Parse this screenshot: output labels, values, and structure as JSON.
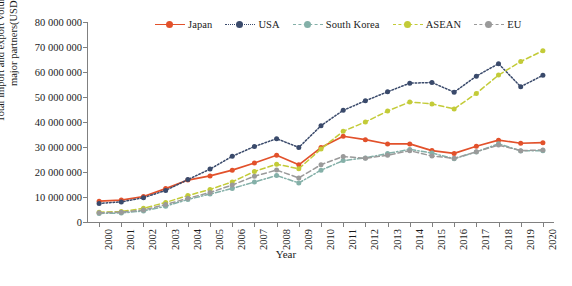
{
  "titles": {
    "y_axis": "Total import and export volume of China with major partners(USD million)",
    "x_axis": "Year"
  },
  "chart_data": {
    "type": "line",
    "title": "",
    "xlabel": "Year",
    "ylabel": "Total import and export volume of China with major partners(USD million)",
    "xlim": [
      2000,
      2020
    ],
    "ylim": [
      0,
      80000000
    ],
    "ytick_step": 10000000,
    "grid": false,
    "legend_position": "top-center",
    "categories": [
      "2000",
      "2001",
      "2002",
      "2003",
      "2004",
      "2005",
      "2006",
      "2007",
      "2008",
      "2009",
      "2010",
      "2011",
      "2012",
      "2013",
      "2014",
      "2015",
      "2016",
      "2017",
      "2018",
      "2019",
      "2020"
    ],
    "ytick_labels": [
      "0",
      "10 000 000",
      "20 000 000",
      "30 000 000",
      "40 000 000",
      "50 000 000",
      "60 000 000",
      "70 000 000",
      "80 000 000"
    ],
    "series": [
      {
        "name": "Japan",
        "color": "#E2512B",
        "dash": "solid",
        "values": [
          8310000,
          8770000,
          10190000,
          13360000,
          16780000,
          18440000,
          20740000,
          23600000,
          26680000,
          22870000,
          29770000,
          34290000,
          32940000,
          31210000,
          31240000,
          28570000,
          27440000,
          30320000,
          32750000,
          31510000,
          31750000
        ]
      },
      {
        "name": "USA",
        "color": "#3A4A6B",
        "dash": "dotted",
        "values": [
          7450000,
          8050000,
          9720000,
          12630000,
          16960000,
          21160000,
          26280000,
          30200000,
          33330000,
          29830000,
          38510000,
          44670000,
          48480000,
          52070000,
          55530000,
          55800000,
          51930000,
          58340000,
          63330000,
          54130000,
          58670000
        ]
      },
      {
        "name": "South Korea",
        "color": "#84B0A8",
        "dash": "dash-dot",
        "values": [
          3450000,
          3590000,
          4410000,
          6320000,
          9000000,
          11190000,
          13430000,
          15990000,
          18610000,
          15620000,
          20710000,
          24560000,
          25640000,
          27420000,
          29050000,
          27580000,
          25270000,
          28020000,
          31310000,
          28450000,
          28520000
        ]
      },
      {
        "name": "ASEAN",
        "color": "#C3CB38",
        "dash": "dashed",
        "values": [
          3950000,
          4160000,
          5480000,
          7830000,
          10580000,
          13040000,
          16040000,
          20240000,
          23110000,
          21300000,
          29210000,
          36280000,
          40010000,
          44360000,
          48040000,
          47220000,
          45220000,
          51440000,
          58760000,
          64190000,
          68500000
        ]
      },
      {
        "name": "EU",
        "color": "#9A9A9A",
        "dash": "dashed",
        "values": [
          3700000,
          3920000,
          4820000,
          6980000,
          9470000,
          11800000,
          14800000,
          18320000,
          20770000,
          17630000,
          22930000,
          26190000,
          25460000,
          26720000,
          28530000,
          26400000,
          25470000,
          28090000,
          30780000,
          28550000,
          28810000
        ]
      }
    ]
  }
}
